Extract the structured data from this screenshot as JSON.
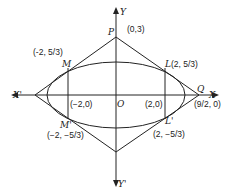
{
  "diagram": {
    "axes": {
      "x_pos": "X",
      "x_neg": "X'",
      "y_pos": "Y",
      "y_neg": "Y'",
      "origin": "O"
    },
    "points": {
      "P": {
        "name": "P",
        "coords": "(0,3)"
      },
      "Q": {
        "name": "Q",
        "coords": "(9/2, 0)"
      },
      "L": {
        "name": "L",
        "coords": "(2, 5/3)"
      },
      "M": {
        "name": "M",
        "coords": "(-2, 5/3)"
      },
      "L_prime": {
        "name": "L'",
        "coords": "(2, −5/3)"
      },
      "M_prime": {
        "name": "M'",
        "coords": "(−2, −5/3)"
      },
      "focus_left": {
        "coords": "(−2,0)"
      },
      "focus_right": {
        "coords": "(2,0)"
      }
    },
    "colors": {
      "stroke": "#222222",
      "background": "#ffffff"
    }
  }
}
